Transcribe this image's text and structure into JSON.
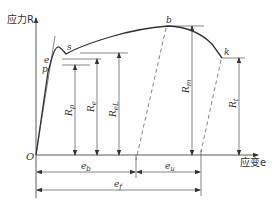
{
  "diagram": {
    "type": "stress-strain curve",
    "axes": {
      "y_label": "应力R",
      "x_label": "应变e",
      "origin_label": "O"
    },
    "points": {
      "p": "p",
      "e": "e",
      "s": "s",
      "b": "b",
      "k": "k"
    },
    "stress_levels": [
      {
        "id": "Rp",
        "base": "R",
        "sub": "p"
      },
      {
        "id": "Re",
        "base": "R",
        "sub": "e"
      },
      {
        "id": "ReL",
        "base": "R",
        "sub": "eL"
      },
      {
        "id": "Rm",
        "base": "R",
        "sub": "m"
      },
      {
        "id": "Rt",
        "base": "R",
        "sub": "t"
      }
    ],
    "strain_dims": [
      {
        "id": "eb",
        "base": "e",
        "sub": "b"
      },
      {
        "id": "eu",
        "base": "e",
        "sub": "u"
      },
      {
        "id": "ef",
        "base": "e",
        "sub": "f"
      }
    ],
    "colors": {
      "line": "#333333",
      "background": "#ffffff"
    }
  }
}
